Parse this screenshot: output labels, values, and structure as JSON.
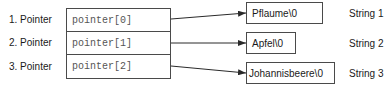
{
  "diagram": {
    "pointers": [
      {
        "label": "1. Pointer",
        "cell": "pointer[0]"
      },
      {
        "label": "2. Pointer",
        "cell": "pointer[1]"
      },
      {
        "label": "3. Pointer",
        "cell": "pointer[2]"
      }
    ],
    "strings": [
      {
        "value": "Pflaume\\0",
        "label": "String 1"
      },
      {
        "value": "Apfel\\0",
        "label": "String 2"
      },
      {
        "value": "Johannisbeere\\0",
        "label": "String 3"
      }
    ],
    "colors": {
      "line": "#4a4a4a",
      "text": "#1a1a1a",
      "mono_text": "#555555"
    }
  }
}
